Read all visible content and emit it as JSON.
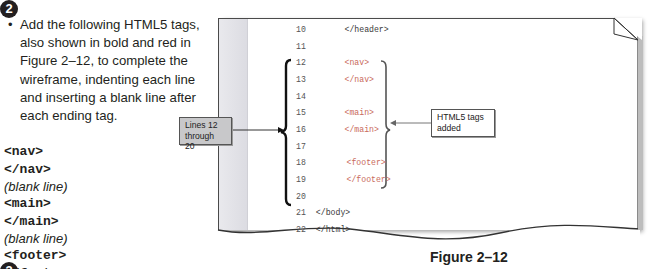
{
  "step": {
    "number": "2",
    "next_number": "3",
    "instruction": "Add the following HTML5 tags, also shown in bold and red in Figure 2–12, to complete the wireframe, indenting each line and inserting a blank line after each ending tag.",
    "bullet": "•"
  },
  "tag_list": [
    {
      "type": "code",
      "text": "<nav>"
    },
    {
      "type": "code",
      "text": "</nav>"
    },
    {
      "type": "note",
      "text": "(blank line)"
    },
    {
      "type": "code",
      "text": "<main>"
    },
    {
      "type": "code",
      "text": "</main>"
    },
    {
      "type": "note",
      "text": "(blank line)"
    },
    {
      "type": "code",
      "text": "<footer>"
    },
    {
      "type": "code",
      "text": "</footer>"
    }
  ],
  "code_figure": {
    "lines": [
      {
        "number": "10",
        "code": "      </header>",
        "added": false
      },
      {
        "number": "11",
        "code": "",
        "added": false
      },
      {
        "number": "12",
        "code": "      <nav>",
        "added": true
      },
      {
        "number": "13",
        "code": "      </nav>",
        "added": true
      },
      {
        "number": "14",
        "code": "",
        "added": false
      },
      {
        "number": "15",
        "code": "      <main>",
        "added": true
      },
      {
        "number": "16",
        "code": "      </main>",
        "added": true
      },
      {
        "number": "17",
        "code": "",
        "added": false
      },
      {
        "number": "18",
        "code": "      <footer>",
        "added": true
      },
      {
        "number": "19",
        "code": "      </footer>",
        "added": true
      },
      {
        "number": "20",
        "code": "",
        "added": false
      },
      {
        "number": "21",
        "code": "  </body>",
        "added": false
      },
      {
        "number": "22",
        "code": "  </html>",
        "added": false
      }
    ],
    "callout_left": {
      "line1": "Lines 12",
      "line2": "through 20"
    },
    "callout_right": {
      "line1": "HTML5 tags",
      "line2": "added"
    },
    "caption": "Figure 2–12"
  },
  "colors": {
    "added_tag": "#c96a5c",
    "text": "#231f20",
    "callout_fill": "#c8c8ca"
  }
}
